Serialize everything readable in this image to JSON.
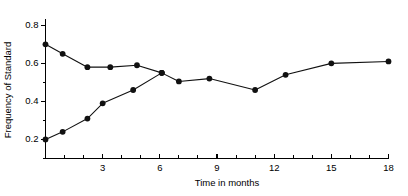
{
  "chart_data": {
    "type": "line",
    "title": "",
    "subtitle": "",
    "xlabel": "Time in months",
    "ylabel": "Frequency of Standard",
    "xlim": [
      0,
      18
    ],
    "ylim": [
      0.1,
      0.82
    ],
    "grid": false,
    "legend": "none",
    "x_ticks_major": [
      3,
      6,
      9,
      12,
      15,
      18
    ],
    "x_ticklabels": [
      "3",
      "6",
      "9",
      "12",
      "15",
      "18"
    ],
    "x_ticks_minor": [
      1,
      2,
      4,
      5,
      7,
      8,
      10,
      11,
      13,
      14,
      16,
      17
    ],
    "y_ticks_major": [
      0.2,
      0.4,
      0.6,
      0.8
    ],
    "y_ticklabels": [
      "0.2",
      "0.4",
      "0.6",
      "0.8"
    ],
    "y_ticks_minor": [
      0.1,
      0.3,
      0.5,
      0.7
    ],
    "marker": "filled-circle",
    "marker_color": "#111111",
    "line_color": "#111111",
    "series": [
      {
        "name": "upper-branch",
        "points": [
          {
            "x": 0.0,
            "y": 0.7
          },
          {
            "x": 0.9,
            "y": 0.65
          },
          {
            "x": 2.2,
            "y": 0.58
          },
          {
            "x": 3.4,
            "y": 0.58
          },
          {
            "x": 4.8,
            "y": 0.59
          },
          {
            "x": 6.1,
            "y": 0.55
          }
        ]
      },
      {
        "name": "lower-branch",
        "points": [
          {
            "x": 0.0,
            "y": 0.2
          },
          {
            "x": 0.9,
            "y": 0.24
          },
          {
            "x": 2.2,
            "y": 0.31
          },
          {
            "x": 3.0,
            "y": 0.39
          },
          {
            "x": 4.6,
            "y": 0.46
          },
          {
            "x": 6.1,
            "y": 0.55
          }
        ]
      },
      {
        "name": "merged-trend",
        "points": [
          {
            "x": 6.1,
            "y": 0.55
          },
          {
            "x": 7.0,
            "y": 0.505
          },
          {
            "x": 8.6,
            "y": 0.52
          },
          {
            "x": 11.0,
            "y": 0.46
          },
          {
            "x": 12.6,
            "y": 0.54
          },
          {
            "x": 15.0,
            "y": 0.6
          },
          {
            "x": 18.0,
            "y": 0.61
          }
        ]
      }
    ]
  }
}
